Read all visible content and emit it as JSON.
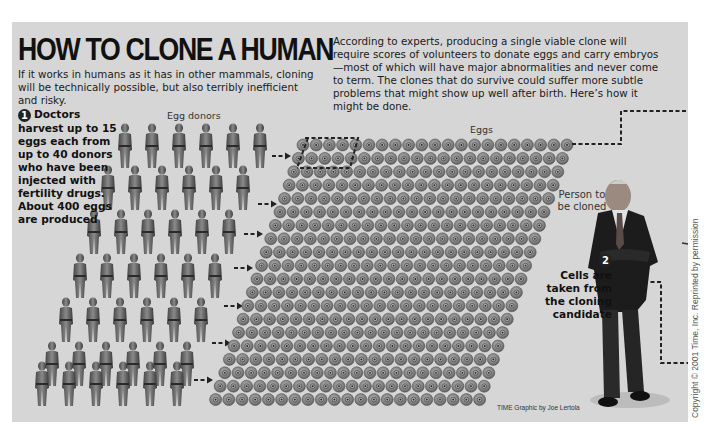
{
  "header": {
    "title": "HOW TO CLONE A HUMAN",
    "subtitle": "If it works in humans as it has in other mammals, cloning will be technically possible, but also terribly inefficient and risky.",
    "intro": "According to experts, producing a single viable clone will require scores of volunteers to donate eggs and carry embryos—most of which will have major abnormalities and never come to term. The clones that do survive could suffer more subtle problems that might show up well after birth. Here’s how it might be done."
  },
  "steps": [
    {
      "number": "1",
      "text": "Doctors harvest up to 15 eggs each from up to 40 donors who have been injected with fertility drugs. About 400 eggs are produced"
    },
    {
      "number": "2",
      "text": "Cells are taken from the cloning candidate"
    }
  ],
  "labels": {
    "egg_donors": "Egg donors",
    "eggs": "Eggs",
    "person_to_be_cloned": "Person to be cloned"
  },
  "credit": "TIME Graphic by Joe Lertola",
  "copyright": "Copyright © 2001 Time, Inc. Reprinted by permission",
  "colors": {
    "panel_background": "#d6d6d6",
    "text": "#111111",
    "egg": "#8a8a8a",
    "dashed_line": "#222222"
  },
  "icons": {
    "donor": "human-figure-icon",
    "egg": "egg-cell-icon",
    "arrow": "dashed-arrow-icon",
    "candidate": "man-in-suit-figure"
  }
}
